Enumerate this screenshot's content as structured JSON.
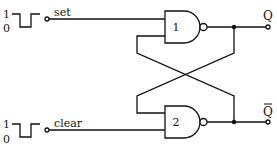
{
  "diagram": {
    "type": "SR latch (cross-coupled NAND gates)",
    "inputs": [
      {
        "label": "set",
        "pulse_high": "1",
        "pulse_low": "0"
      },
      {
        "label": "clear",
        "pulse_high": "1",
        "pulse_low": "0"
      }
    ],
    "gates": [
      {
        "id": "1",
        "kind": "NAND"
      },
      {
        "id": "2",
        "kind": "NAND"
      }
    ],
    "outputs": [
      {
        "label": "Q"
      },
      {
        "label": "Q",
        "overbar": true
      }
    ],
    "colors": {
      "ink": "#111111",
      "background": "#ffffff"
    }
  }
}
